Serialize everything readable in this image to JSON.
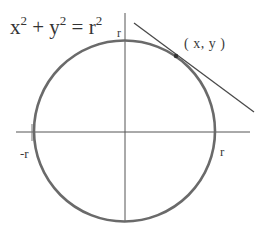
{
  "diagram": {
    "equation": {
      "x_base": "x",
      "x_exp": "2",
      "plus": " + ",
      "y_base": "y",
      "y_exp": "2",
      "equals": " = ",
      "r_base": "r",
      "r_exp": "2"
    },
    "labels": {
      "top_radius": "r",
      "tangent_point": "( x, y )",
      "neg_radius": "-r",
      "pos_radius": "r"
    },
    "geometry": {
      "circle": {
        "cx": 124.5,
        "cy": 131,
        "r": 90.5
      },
      "x_axis": {
        "x1": 16,
        "y1": 132,
        "x2": 250,
        "y2": 132
      },
      "y_axis": {
        "x1": 125,
        "y1": 13,
        "x2": 125,
        "y2": 222
      },
      "tangent_point": {
        "x": 176,
        "y": 56
      },
      "tangent_line": {
        "x1": 134,
        "y1": 23,
        "x2": 254,
        "y2": 112
      }
    },
    "colors": {
      "circle": "#6a6a6a",
      "axes": "#555555",
      "tangent": "#4a4a4a",
      "text": "#333333"
    }
  }
}
